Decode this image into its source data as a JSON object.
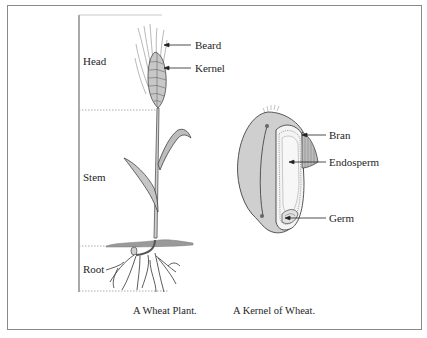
{
  "figure": {
    "plant": {
      "sections": [
        {
          "label": "Head"
        },
        {
          "label": "Stem"
        },
        {
          "label": "Root"
        }
      ],
      "callouts": [
        {
          "label": "Beard"
        },
        {
          "label": "Kernel"
        }
      ],
      "caption": "A Wheat Plant."
    },
    "kernel": {
      "callouts": [
        {
          "label": "Bran"
        },
        {
          "label": "Endosperm"
        },
        {
          "label": "Germ"
        }
      ],
      "caption": "A Kernel of Wheat."
    },
    "colors": {
      "frame": "#8a8a8a",
      "ink": "#222222",
      "fill_light": "#e6e6e6",
      "fill_mid": "#bdbdbd",
      "soil": "#9a9a9a"
    }
  }
}
